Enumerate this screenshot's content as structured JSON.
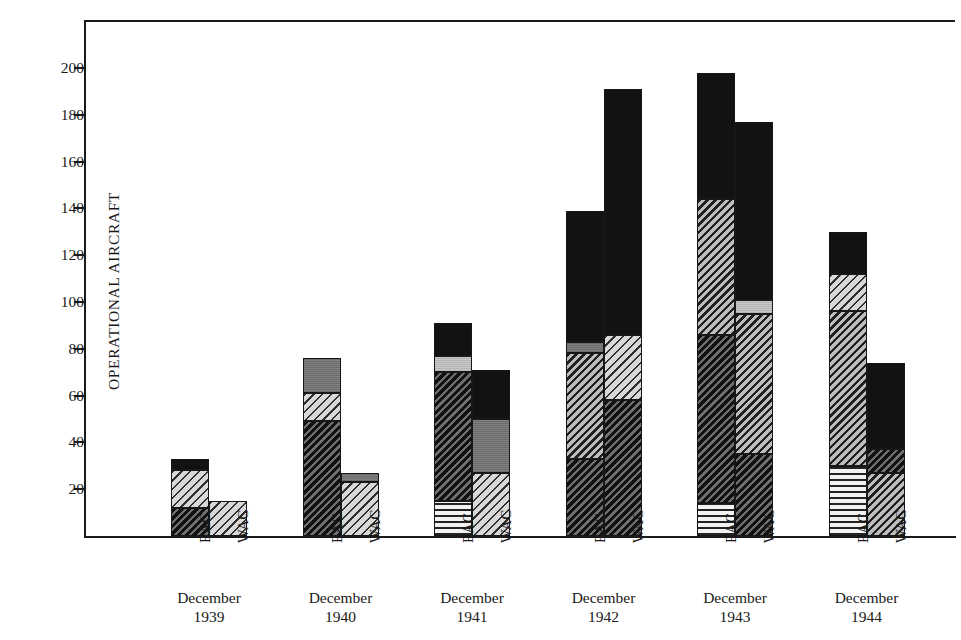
{
  "chart_data": {
    "type": "bar",
    "title": "",
    "subtitle": "",
    "xlabel": "",
    "ylabel": "OPERATIONAL AIRCRAFT",
    "ylim": [
      0,
      215
    ],
    "yticks": [
      20,
      40,
      60,
      80,
      100,
      120,
      140,
      160,
      180,
      200
    ],
    "ytick_labels": [
      "20",
      "40",
      "60",
      "80",
      "100",
      "120",
      "140",
      "160",
      "180",
      "200"
    ],
    "grid": false,
    "legend": "none",
    "stacked": true,
    "categories": [
      "December 1939",
      "December 1940",
      "December 1941",
      "December 1942",
      "December 1943",
      "December 1944"
    ],
    "series_labels": [
      "EAC",
      "WAC"
    ],
    "pattern_names": [
      "horizontal-lines",
      "light-diagonal-hatch",
      "medium-diagonal-hatch",
      "dark-diagonal-hatch",
      "light-gray-solid",
      "medium-gray-solid",
      "solid-black"
    ],
    "groups": [
      {
        "year": "1939",
        "month": "December",
        "bars": [
          {
            "label": "EAC",
            "total": 33,
            "segments": [
              {
                "value": 12,
                "pattern": "dark-diagonal-hatch"
              },
              {
                "value": 16,
                "pattern": "light-diagonal-hatch"
              },
              {
                "value": 5,
                "pattern": "solid-black"
              }
            ]
          },
          {
            "label": "WAC",
            "total": 15,
            "segments": [
              {
                "value": 15,
                "pattern": "light-diagonal-hatch"
              }
            ]
          }
        ]
      },
      {
        "year": "1940",
        "month": "December",
        "bars": [
          {
            "label": "EAC",
            "total": 76,
            "segments": [
              {
                "value": 49,
                "pattern": "dark-diagonal-hatch"
              },
              {
                "value": 12,
                "pattern": "light-diagonal-hatch"
              },
              {
                "value": 15,
                "pattern": "medium-gray-solid"
              }
            ]
          },
          {
            "label": "WAC",
            "total": 27,
            "segments": [
              {
                "value": 23,
                "pattern": "light-diagonal-hatch"
              },
              {
                "value": 4,
                "pattern": "medium-gray-solid"
              }
            ]
          }
        ]
      },
      {
        "year": "1941",
        "month": "December",
        "bars": [
          {
            "label": "EAC",
            "total": 91,
            "segments": [
              {
                "value": 15,
                "pattern": "horizontal-lines"
              },
              {
                "value": 55,
                "pattern": "dark-diagonal-hatch"
              },
              {
                "value": 7,
                "pattern": "light-gray-solid"
              },
              {
                "value": 14,
                "pattern": "solid-black"
              }
            ]
          },
          {
            "label": "WAC",
            "total": 71,
            "segments": [
              {
                "value": 27,
                "pattern": "light-diagonal-hatch"
              },
              {
                "value": 23,
                "pattern": "medium-gray-solid"
              },
              {
                "value": 21,
                "pattern": "solid-black"
              }
            ]
          }
        ]
      },
      {
        "year": "1942",
        "month": "December",
        "bars": [
          {
            "label": "EAC",
            "total": 139,
            "segments": [
              {
                "value": 33,
                "pattern": "dark-diagonal-hatch"
              },
              {
                "value": 45,
                "pattern": "medium-diagonal-hatch"
              },
              {
                "value": 5,
                "pattern": "medium-gray-solid"
              },
              {
                "value": 56,
                "pattern": "solid-black"
              }
            ]
          },
          {
            "label": "WAC",
            "total": 191,
            "segments": [
              {
                "value": 58,
                "pattern": "dark-diagonal-hatch"
              },
              {
                "value": 28,
                "pattern": "light-diagonal-hatch"
              },
              {
                "value": 105,
                "pattern": "solid-black"
              }
            ]
          }
        ]
      },
      {
        "year": "1943",
        "month": "December",
        "bars": [
          {
            "label": "EAC",
            "total": 198,
            "segments": [
              {
                "value": 14,
                "pattern": "horizontal-lines"
              },
              {
                "value": 72,
                "pattern": "dark-diagonal-hatch"
              },
              {
                "value": 58,
                "pattern": "medium-diagonal-hatch"
              },
              {
                "value": 54,
                "pattern": "solid-black"
              }
            ]
          },
          {
            "label": "WAC",
            "total": 177,
            "segments": [
              {
                "value": 35,
                "pattern": "dark-diagonal-hatch"
              },
              {
                "value": 60,
                "pattern": "medium-diagonal-hatch"
              },
              {
                "value": 6,
                "pattern": "light-gray-solid"
              },
              {
                "value": 76,
                "pattern": "solid-black"
              }
            ]
          }
        ]
      },
      {
        "year": "1944",
        "month": "December",
        "bars": [
          {
            "label": "EAC",
            "total": 130,
            "segments": [
              {
                "value": 30,
                "pattern": "horizontal-lines"
              },
              {
                "value": 66,
                "pattern": "medium-diagonal-hatch"
              },
              {
                "value": 16,
                "pattern": "light-diagonal-hatch"
              },
              {
                "value": 18,
                "pattern": "solid-black"
              }
            ]
          },
          {
            "label": "WAC",
            "total": 74,
            "segments": [
              {
                "value": 27,
                "pattern": "medium-diagonal-hatch"
              },
              {
                "value": 10,
                "pattern": "dark-diagonal-hatch"
              },
              {
                "value": 37,
                "pattern": "solid-black"
              }
            ]
          }
        ]
      }
    ]
  },
  "colors": {
    "ink": "#1a1a1a",
    "background": "#ffffff",
    "black_fill": "#121212",
    "gray_fill": "#767676",
    "light_gray_fill": "#c0c0c0"
  }
}
